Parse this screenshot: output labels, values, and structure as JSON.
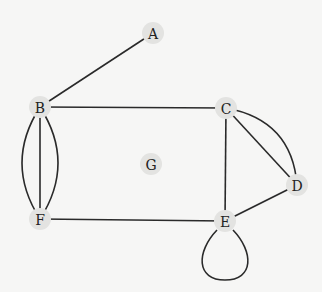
{
  "diagram": {
    "type": "undirected-multigraph",
    "nodes": [
      {
        "id": "A",
        "label": "A",
        "x": 153,
        "y": 33
      },
      {
        "id": "B",
        "label": "B",
        "x": 40,
        "y": 107
      },
      {
        "id": "C",
        "label": "C",
        "x": 226,
        "y": 108
      },
      {
        "id": "D",
        "label": "D",
        "x": 297,
        "y": 185
      },
      {
        "id": "E",
        "label": "E",
        "x": 225,
        "y": 221
      },
      {
        "id": "F",
        "label": "F",
        "x": 40,
        "y": 219
      },
      {
        "id": "G",
        "label": "G",
        "x": 151,
        "y": 164
      }
    ],
    "edges": [
      {
        "from": "A",
        "to": "B",
        "kind": "straight"
      },
      {
        "from": "B",
        "to": "C",
        "kind": "straight"
      },
      {
        "from": "B",
        "to": "F",
        "kind": "curve-left"
      },
      {
        "from": "B",
        "to": "F",
        "kind": "straight"
      },
      {
        "from": "B",
        "to": "F",
        "kind": "curve-right"
      },
      {
        "from": "C",
        "to": "D",
        "kind": "straight"
      },
      {
        "from": "C",
        "to": "D",
        "kind": "curve-outer"
      },
      {
        "from": "C",
        "to": "E",
        "kind": "straight"
      },
      {
        "from": "D",
        "to": "E",
        "kind": "straight"
      },
      {
        "from": "F",
        "to": "E",
        "kind": "straight"
      },
      {
        "from": "E",
        "to": "E",
        "kind": "loop"
      }
    ],
    "colors": {
      "background": "#f6f6f5",
      "node_fill": "#e3e3e1",
      "edge": "#2a2a2a",
      "label": "#222222"
    }
  }
}
